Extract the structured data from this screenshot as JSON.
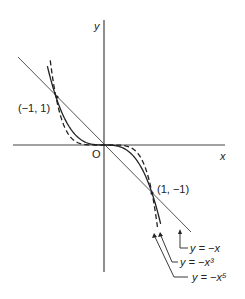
{
  "diagram": {
    "axes": {
      "x_label": "x",
      "y_label": "y",
      "origin_label": "O"
    },
    "points": [
      {
        "label": "(−1, 1)",
        "x": -1,
        "y": 1
      },
      {
        "label": "(1, −1)",
        "x": 1,
        "y": -1
      }
    ],
    "curves": [
      {
        "label": "y = −x",
        "style": "solid-thin",
        "exponent": 1
      },
      {
        "label": "y = −x³",
        "style": "solid",
        "exponent": 3
      },
      {
        "label": "y = −x⁵",
        "style": "dashed",
        "exponent": 5
      }
    ],
    "colors": {
      "ink": "#222222",
      "line": "#555555",
      "background": "#ffffff"
    }
  }
}
